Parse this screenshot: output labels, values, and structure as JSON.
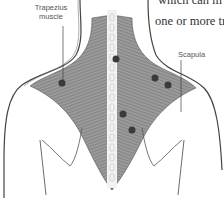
{
  "figure": {
    "text_fragments": [
      "which can m",
      "one or more tr"
    ],
    "labels": {
      "trapezius": [
        "Trapezius",
        "muscle"
      ],
      "scapula": "Scapula"
    },
    "trigger_points": [
      {
        "x": 62,
        "y": 83
      },
      {
        "x": 116,
        "y": 59
      },
      {
        "x": 155,
        "y": 78
      },
      {
        "x": 168,
        "y": 85
      },
      {
        "x": 123,
        "y": 114
      },
      {
        "x": 132,
        "y": 130
      }
    ],
    "colors": {
      "muscle": "#8a8a8a",
      "outline": "#444444",
      "trigger_point": "#3a3a3a",
      "spine": "#f2f2f2"
    }
  }
}
